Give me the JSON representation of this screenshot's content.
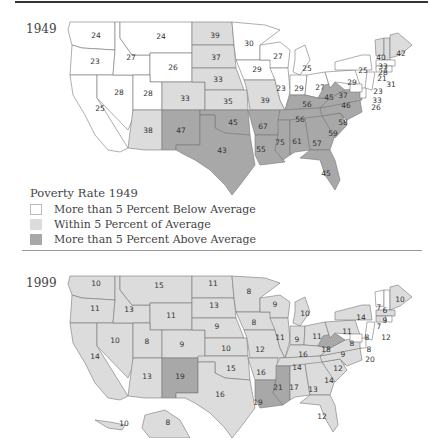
{
  "maps": [
    {
      "year": "1949",
      "legend": {
        "title": "Poverty Rate 1949",
        "items": [
          {
            "label": "More than 5 Percent Below Average",
            "color": "#ffffff"
          },
          {
            "label": "Within 5 Percent of Average",
            "color": "#dcdcdc"
          },
          {
            "label": "More than 5 Percent Above Average",
            "color": "#a8a8a8"
          }
        ]
      },
      "states": {
        "WA": "24",
        "OR": "23",
        "CA": "25",
        "NV": "28",
        "ID": "27",
        "MT": "24",
        "WY": "26",
        "UT": "28",
        "AZ": "38",
        "CO": "33",
        "NM": "47",
        "ND": "39",
        "SD": "37",
        "NE": "33",
        "KS": "35",
        "OK": "45",
        "TX": "43",
        "MN": "30",
        "IA": "29",
        "MO": "39",
        "AR": "67",
        "LA": "55",
        "WI": "27",
        "IL": "23",
        "MI": "25",
        "IN": "29",
        "OH": "27",
        "KY": "56",
        "TN": "56",
        "MS": "75",
        "AL": "61",
        "GA": "57",
        "FL": "45",
        "SC": "59",
        "NC": "58",
        "VA": "46",
        "WV": "45",
        "PA": "29",
        "NY": "25",
        "VT": "40",
        "NH": "33",
        "ME": "42",
        "MA": "28",
        "CT": "21",
        "RI": "31",
        "NJ": "23",
        "DE": "33",
        "MD": "37",
        "DC": "26"
      }
    },
    {
      "year": "1999",
      "states": {
        "WA": "10",
        "OR": "11",
        "CA": "14",
        "NV": "10",
        "ID": "13",
        "MT": "15",
        "WY": "11",
        "UT": "8",
        "AZ": "13",
        "CO": "9",
        "NM": "19",
        "ND": "11",
        "SD": "13",
        "NE": "9",
        "KS": "10",
        "OK": "15",
        "TX": "16",
        "MN": "8",
        "IA": "8",
        "MO": "12",
        "AR": "16",
        "LA": "19",
        "WI": "9",
        "IL": "11",
        "MI": "10",
        "IN": "9",
        "OH": "11",
        "KY": "16",
        "TN": "14",
        "MS": "21",
        "AL": "17",
        "GA": "13",
        "FL": "12",
        "SC": "14",
        "NC": "12",
        "VA": "9",
        "WV": "18",
        "PA": "11",
        "NY": "14",
        "VT": "7",
        "NH": "6",
        "ME": "10",
        "MA": "9",
        "CT": "7",
        "RI": "12",
        "NJ": "8",
        "DE": "8",
        "MD": "8",
        "DC": "20",
        "AK": "8",
        "HI": "10"
      }
    }
  ],
  "colors": {
    "below": "#ffffff",
    "within": "#dcdcdc",
    "above": "#a8a8a8",
    "border": "#777777"
  }
}
